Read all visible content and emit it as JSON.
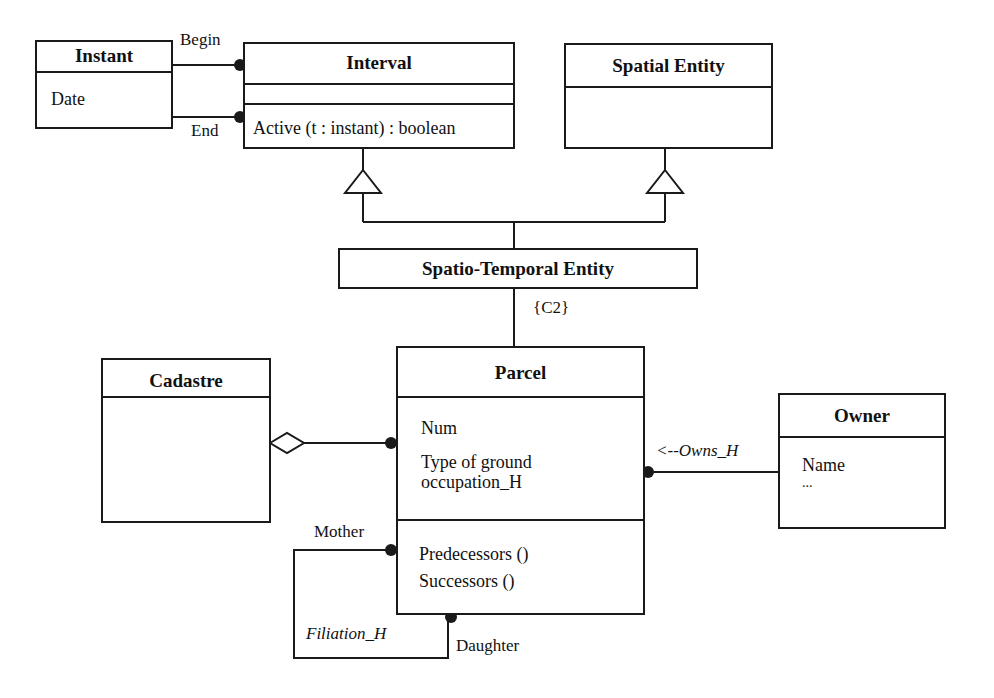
{
  "diagram": {
    "type": "UML class diagram",
    "classes": {
      "instant": {
        "name": "Instant",
        "attributes": [
          "Date"
        ]
      },
      "interval": {
        "name": "Interval",
        "attributes": [],
        "operations": [
          "Active (t : instant) : boolean"
        ]
      },
      "spatial_entity": {
        "name": "Spatial Entity"
      },
      "spatio_temporal_entity": {
        "name": "Spatio-Temporal Entity"
      },
      "cadastre": {
        "name": "Cadastre"
      },
      "parcel": {
        "name": "Parcel",
        "attributes": [
          "Num",
          "Type of ground",
          "occupation_H"
        ],
        "operations": [
          "Predecessors ()",
          "Successors ()"
        ]
      },
      "owner": {
        "name": "Owner",
        "attributes": [
          "Name",
          "..."
        ]
      }
    },
    "relations": {
      "begin_role": "Begin",
      "end_role": "End",
      "constraint": "{C2}",
      "owns": "<--Owns_H",
      "mother_role": "Mother",
      "daughter_role": "Daughter",
      "filiation": "Filiation_H"
    },
    "colors": {
      "line": "#1a1a1a",
      "background": "#ffffff"
    }
  }
}
